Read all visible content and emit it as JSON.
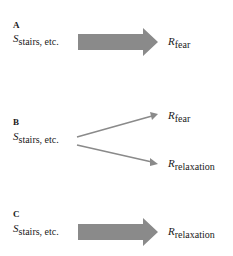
{
  "panels": [
    {
      "label": "A",
      "stimulus": {
        "base": "S",
        "sub": "stairs, etc."
      },
      "responses": [
        {
          "base": "R",
          "sub": "fear"
        }
      ],
      "arrow_type": "thick"
    },
    {
      "label": "B",
      "stimulus": {
        "base": "S",
        "sub": "stairs, etc."
      },
      "responses": [
        {
          "base": "R",
          "sub": "fear"
        },
        {
          "base": "R",
          "sub": "relaxation"
        }
      ],
      "arrow_type": "thin-branching"
    },
    {
      "label": "C",
      "stimulus": {
        "base": "S",
        "sub": "stairs, etc."
      },
      "responses": [
        {
          "base": "R",
          "sub": "relaxation"
        }
      ],
      "arrow_type": "thick"
    }
  ],
  "colors": {
    "arrow": "#8a8a8a",
    "text": "#1a1a1a",
    "background": "#ffffff"
  }
}
